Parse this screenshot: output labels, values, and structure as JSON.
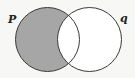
{
  "diagram": {
    "type": "venn",
    "sets": [
      {
        "name": "p",
        "label": "P",
        "cx": 47.5,
        "cy": 39.5,
        "r": 32
      },
      {
        "name": "q",
        "label": "q",
        "cx": 89.5,
        "cy": 39.5,
        "r": 32
      }
    ],
    "shaded_region": "p-only",
    "colors": {
      "shade": "#a6a6a6",
      "stroke": "#3a3a3a",
      "background": "#f7f7f5",
      "unshaded": "#ffffff"
    }
  }
}
